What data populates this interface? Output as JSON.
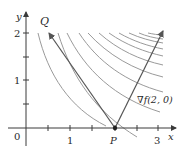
{
  "figure": {
    "axes": {
      "x_label": "x",
      "y_label": "y",
      "origin_label": "0",
      "x_tick_labels": [
        {
          "value": 1,
          "label": "1"
        },
        {
          "value": 3,
          "label": "3"
        }
      ],
      "y_tick_labels": [
        {
          "value": 1,
          "label": "1"
        },
        {
          "value": 2,
          "label": "2"
        }
      ],
      "x_ticks": [
        0.5,
        1,
        1.5,
        2,
        2.5,
        3
      ],
      "y_ticks": [
        0.5,
        1,
        1.5,
        2
      ]
    },
    "points": {
      "P": {
        "label": "P",
        "x": 2,
        "y": 0
      },
      "Q": {
        "label": "Q"
      }
    },
    "vectors": {
      "gradient": {
        "label": "∇f(2, 0)"
      },
      "pq": {
        "label": "PQ"
      }
    },
    "colors": {
      "axis": "#3a3a3a",
      "curves": "#9a9a9a",
      "vectors": "#555555",
      "text": "#2a2a2a"
    },
    "level_curve_count": 11
  }
}
